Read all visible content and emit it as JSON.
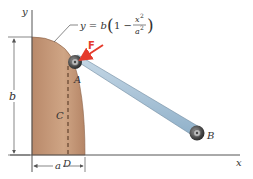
{
  "diagram": {
    "equation": {
      "lhs": "y = b",
      "paren_open": "(",
      "one_minus": "1 −",
      "num": "x",
      "num_exp": "2",
      "den": "a",
      "den_exp": "2",
      "paren_close": ")"
    },
    "labels": {
      "y_axis": "y",
      "x_axis": "x",
      "force": "F",
      "point_a": "A",
      "point_b": "B",
      "point_c": "C",
      "point_d": "D",
      "dim_b": "b",
      "dim_a": "a"
    },
    "colors": {
      "region_fill": "#c79a78",
      "region_fill_dark": "#a9765a",
      "bar": "#a9c3d8",
      "bar_edge": "#6f8aa0",
      "force": "#e53b2c",
      "axis": "#555555",
      "roller": "#5c5c5c"
    }
  }
}
